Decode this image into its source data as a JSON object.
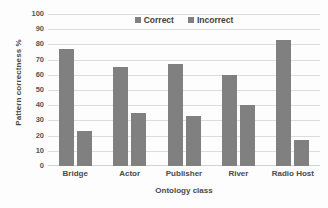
{
  "chart_data": {
    "type": "bar",
    "title": "",
    "categories": [
      "Bridge",
      "Actor",
      "Publisher",
      "River",
      "Radio Host"
    ],
    "series": [
      {
        "name": "Correct",
        "values": [
          77,
          65,
          67,
          60,
          83
        ],
        "color": "#808080"
      },
      {
        "name": "Incorrect",
        "values": [
          23,
          35,
          33,
          40,
          17
        ],
        "color": "#808080"
      }
    ],
    "xlabel": "Ontology class",
    "ylabel": "Pattern correctness %",
    "ylim": [
      0,
      100
    ],
    "ytick_step": 10,
    "yticks": [
      0,
      10,
      20,
      30,
      40,
      50,
      60,
      70,
      80,
      90,
      100
    ],
    "grid": true,
    "legend_position": "top-center",
    "background_color": "#fdfdfd",
    "gridline_color": "#dcdcdc",
    "axis_color": "#d2d2d2",
    "text_color": "#4a4a4a"
  }
}
